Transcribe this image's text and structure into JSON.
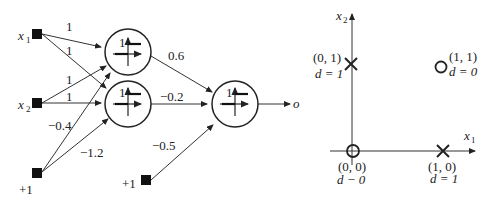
{
  "network": {
    "inputs": [
      {
        "label": "x",
        "sub": "1"
      },
      {
        "label": "x",
        "sub": "2"
      },
      {
        "label": "+1"
      }
    ],
    "output_bias_label": "+1",
    "output_label": "o",
    "step_label": "1",
    "weights": {
      "x1_h1": "1",
      "x1_h2": "1",
      "x2_h1": "1",
      "x2_h2": "1",
      "b_h1": "−0.4",
      "b_h2": "−1.2",
      "h1_o": "0.6",
      "h2_o": "−0.2",
      "b_o": "−0.5"
    }
  },
  "plot": {
    "x_axis": {
      "label": "x",
      "sub": "1"
    },
    "y_axis": {
      "label": "x",
      "sub": "2"
    },
    "points": [
      {
        "coord": "(0, 0)",
        "d": "d − 0",
        "marker": "circle"
      },
      {
        "coord": "(0, 1)",
        "d": "d = 1",
        "marker": "cross"
      },
      {
        "coord": "(1, 0)",
        "d": "d = 1",
        "marker": "cross"
      },
      {
        "coord": "(1, 1)",
        "d": "d = 0",
        "marker": "circle"
      }
    ]
  }
}
